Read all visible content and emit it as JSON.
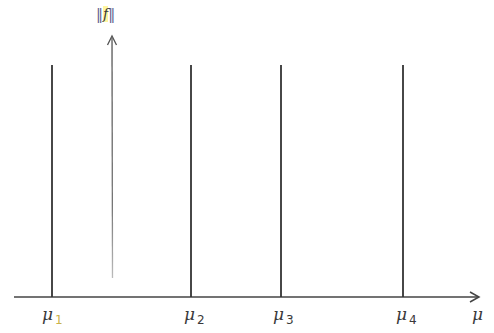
{
  "diagram": {
    "type": "spectral-line-plot",
    "y_axis": {
      "label": "‖f‖",
      "label_inner": "f",
      "bars": "‖",
      "arrow": "up"
    },
    "x_axis": {
      "label": "μ",
      "arrow": "right"
    },
    "lines": [
      {
        "id": "mu1",
        "symbol": "μ",
        "subscript": "1",
        "x": 52
      },
      {
        "id": "mu2",
        "symbol": "μ",
        "subscript": "2",
        "x": 191
      },
      {
        "id": "mu3",
        "symbol": "μ",
        "subscript": "3",
        "x": 281
      },
      {
        "id": "mu4",
        "symbol": "μ",
        "subscript": "4",
        "x": 403
      }
    ],
    "colors": {
      "ink": "#3a3a3a",
      "highlight": "#fff6a0",
      "faint_subscript": "#c9b24a"
    }
  }
}
